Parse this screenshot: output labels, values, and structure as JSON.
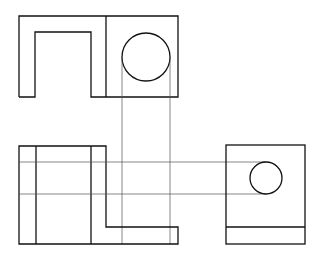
{
  "drawing": {
    "title": "Orthographic projection: front, top and side views of a bracket with a cylindrical hole",
    "type": "orthographic-projection",
    "views": [
      {
        "name": "top-view",
        "features": [
          "U-shaped slot",
          "circular hole"
        ]
      },
      {
        "name": "front-view",
        "features": [
          "L-shaped profile",
          "hidden-edge lines"
        ]
      },
      {
        "name": "side-view",
        "features": [
          "circular hole",
          "base ledge"
        ]
      }
    ],
    "colors": {
      "background": "#ffffff",
      "object_line": "#111111",
      "projection_line": "#555555"
    }
  }
}
